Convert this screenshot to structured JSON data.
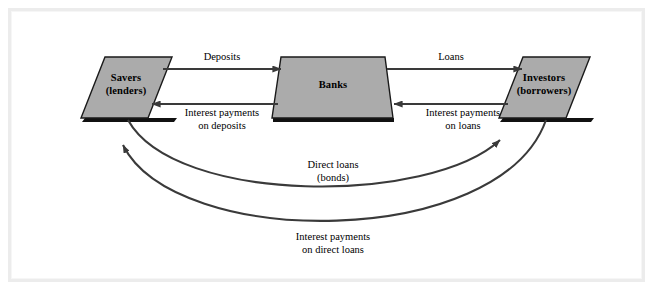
{
  "diagram": {
    "colors": {
      "node_fill": "#ababab",
      "node_stroke": "#1a1a1a",
      "shadow": "#111111",
      "arrow": "#3a3a3a",
      "background": "#ffffff",
      "frame": "#ececec"
    },
    "nodes": [
      {
        "id": "savers",
        "shape": "parallelogram",
        "line1": "Savers",
        "line2": "(lenders)"
      },
      {
        "id": "banks",
        "shape": "trapezoid",
        "line1": "Banks",
        "line2": ""
      },
      {
        "id": "investors",
        "shape": "parallelogram",
        "line1": "Investors",
        "line2": "(borrowers)"
      }
    ],
    "edges": [
      {
        "id": "deposits",
        "from": "savers",
        "to": "banks",
        "kind": "straight",
        "line1": "Deposits",
        "line2": ""
      },
      {
        "id": "interest-on-deposits",
        "from": "banks",
        "to": "savers",
        "kind": "straight",
        "line1": "Interest payments",
        "line2": "on deposits"
      },
      {
        "id": "loans",
        "from": "banks",
        "to": "investors",
        "kind": "straight",
        "line1": "Loans",
        "line2": ""
      },
      {
        "id": "interest-on-loans",
        "from": "investors",
        "to": "banks",
        "kind": "straight",
        "line1": "Interest payments",
        "line2": "on loans"
      },
      {
        "id": "direct-loans",
        "from": "savers",
        "to": "investors",
        "kind": "curved",
        "line1": "Direct loans",
        "line2": "(bonds)"
      },
      {
        "id": "interest-on-direct-loans",
        "from": "investors",
        "to": "savers",
        "kind": "curved",
        "line1": "Interest payments",
        "line2": "on direct loans"
      }
    ]
  }
}
